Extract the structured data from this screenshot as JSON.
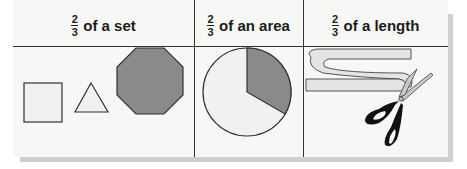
{
  "columns": [
    {
      "numerator": "2",
      "denominator": "3",
      "label": "of a set",
      "illustration": "set-of-shapes"
    },
    {
      "numerator": "2",
      "denominator": "3",
      "label": "of an area",
      "illustration": "pie-circle"
    },
    {
      "numerator": "2",
      "denominator": "3",
      "label": "of a length",
      "illustration": "ribbon-and-scissors"
    }
  ],
  "set_shapes": [
    {
      "shape": "square",
      "shaded": false
    },
    {
      "shape": "triangle",
      "shaded": false
    },
    {
      "shape": "octagon",
      "shaded": true
    }
  ],
  "area_circle": {
    "shaded_fraction": "1/3",
    "unshaded_fraction": "2/3"
  },
  "colors": {
    "shaded": "#8a8a8a",
    "unshaded": "#f1f1ef",
    "line": "#333333",
    "background": "#f7f7f5",
    "shadow": "#cfcfcf"
  }
}
